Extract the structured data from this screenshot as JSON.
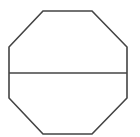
{
  "diagram": {
    "shape": "octagon",
    "background": "#ffffff",
    "stroke_color": "#444444",
    "stroke_width": 1.6,
    "octagon_points": [
      [
        43,
        11
      ],
      [
        92,
        11
      ],
      [
        127,
        47
      ],
      [
        127,
        98
      ],
      [
        92,
        134
      ],
      [
        43,
        134
      ],
      [
        9,
        98
      ],
      [
        9,
        47
      ]
    ],
    "divider_line": {
      "x1": 9,
      "y1": 73,
      "x2": 127,
      "y2": 73
    }
  }
}
